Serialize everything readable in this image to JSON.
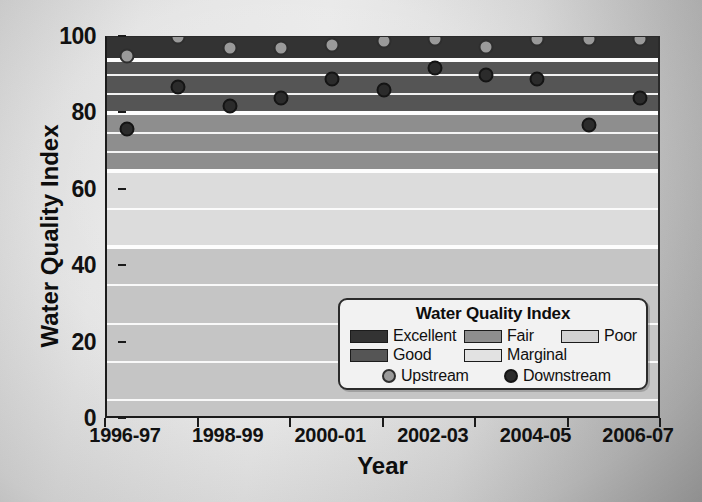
{
  "chart_data": {
    "type": "scatter",
    "title": "",
    "xlabel": "Year",
    "ylabel": "Water Quality Index",
    "ylim": [
      0,
      100
    ],
    "yticks": [
      0,
      20,
      40,
      60,
      80,
      100
    ],
    "ytick_labels": [
      "0",
      "20",
      "40",
      "60",
      "80",
      "100"
    ],
    "grid": true,
    "categories": [
      "1996-97",
      "1997-98",
      "1998-99",
      "1999-2000",
      "2000-01",
      "2001-02",
      "2002-03",
      "2003-04",
      "2004-05",
      "2005-06",
      "2006-07"
    ],
    "xtick_labels": [
      "1996-97",
      "1998-99",
      "2000-01",
      "2002-03",
      "2004-05",
      "2006-07"
    ],
    "series": [
      {
        "name": "Upstream",
        "color": "#9a9a9a",
        "values": [
          95,
          100,
          97,
          97,
          98,
          99,
          99.5,
          97.5,
          99.5,
          99.5,
          99.5
        ]
      },
      {
        "name": "Downstream",
        "color": "#2b2b2b",
        "values": [
          76,
          87,
          82,
          84,
          89,
          86,
          92,
          90,
          89,
          77,
          84
        ]
      }
    ],
    "bands": [
      {
        "label": "Excellent",
        "from": 94,
        "to": 100,
        "color": "#333333"
      },
      {
        "label": "Good",
        "from": 80,
        "to": 94,
        "color": "#555555"
      },
      {
        "label": "Fair",
        "from": 65,
        "to": 80,
        "color": "#8e8e8e"
      },
      {
        "label": "Marginal",
        "from": 45,
        "to": 65,
        "color": "#dcdcdc"
      },
      {
        "label": "Poor",
        "from": 0,
        "to": 45,
        "color": "#c5c5c5"
      }
    ],
    "gridlines": [
      5,
      15,
      25,
      35,
      45,
      55,
      70,
      75,
      85,
      90
    ]
  },
  "axes": {
    "y_title": "Water Quality Index",
    "x_title": "Year",
    "y_ticks": [
      "100",
      "80",
      "60",
      "40",
      "20",
      "0"
    ],
    "x_ticks": [
      "1996-97",
      "1998-99",
      "2000-01",
      "2002-03",
      "2004-05",
      "2006-07"
    ]
  },
  "legend": {
    "title": "Water Quality Index",
    "bands": [
      {
        "label": "Excellent",
        "color": "#333333"
      },
      {
        "label": "Fair",
        "color": "#8e8e8e"
      },
      {
        "label": "Poor",
        "color": "#d2d2d2"
      },
      {
        "label": "Good",
        "color": "#555555"
      },
      {
        "label": "Marginal",
        "color": "#e2e2e2"
      }
    ],
    "series": [
      {
        "label": "Upstream",
        "marker": "upstream-marker"
      },
      {
        "label": "Downstream",
        "marker": "downstream-marker"
      }
    ]
  }
}
